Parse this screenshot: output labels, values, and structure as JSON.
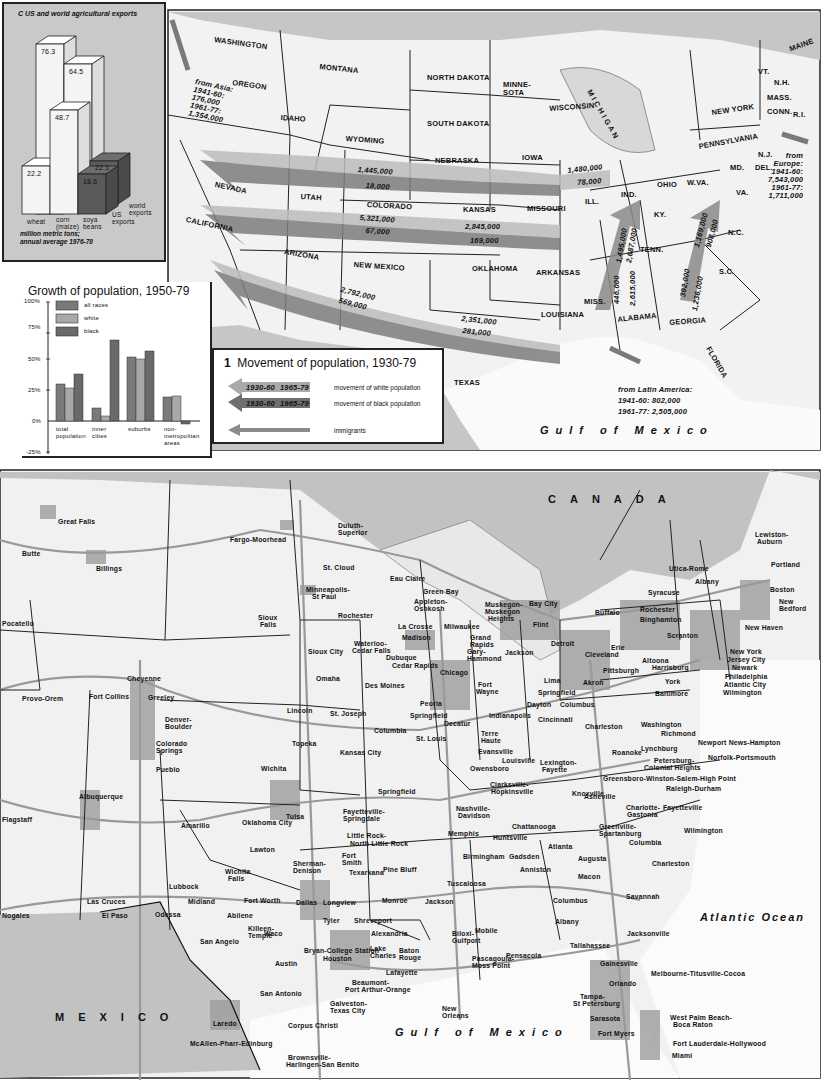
{
  "chart_data": [
    {
      "type": "bar",
      "title": "C  US and world agricultural exports",
      "categories": [
        "wheat",
        "corn (maize)",
        "soya beans"
      ],
      "series": [
        {
          "name": "US exports",
          "values": [
            22.2,
            48.7,
            18.6
          ]
        },
        {
          "name": "world exports",
          "values": [
            76.3,
            64.5,
            22.1
          ]
        }
      ],
      "ylabel": "million metric tons; annual average 1976-78",
      "legend": [
        "world exports",
        "US exports"
      ]
    },
    {
      "type": "bar",
      "title": "Growth of population, 1950-79",
      "categories": [
        "total population",
        "inner cities",
        "suburbs",
        "non-metropolitan areas"
      ],
      "series": [
        {
          "name": "all races",
          "values": [
            30,
            11,
            52,
            20
          ]
        },
        {
          "name": "white",
          "values": [
            27,
            4,
            51,
            20
          ]
        },
        {
          "name": "black",
          "values": [
            38,
            65,
            56,
            -2
          ]
        }
      ],
      "yticks": [
        "100%",
        "75%",
        "50%",
        "25%",
        "0%",
        "-25%"
      ],
      "ylim": [
        -25,
        100
      ],
      "grid": false,
      "legend_position": "top-left"
    }
  ],
  "chartC": {
    "title": "C  US and world agricultural exports",
    "values": {
      "wheat_world": "76.3",
      "corn_world": "64.5",
      "corn_us": "48.7",
      "wheat_us": "22.2",
      "soya_world": "22.1",
      "soya_us": "18.6"
    },
    "categories": [
      "wheat",
      "corn",
      "(maize)",
      "soya",
      "beans"
    ],
    "legend_world": [
      "world",
      "exports"
    ],
    "legend_us": [
      "US",
      "exports"
    ],
    "footnote": [
      "million metric tons;",
      "annual average 1976-78"
    ]
  },
  "chartG": {
    "title": "Growth of population, 1950-79",
    "yticks": [
      "100%",
      "75%",
      "50%",
      "25%",
      "0%",
      "-25%"
    ],
    "legend": [
      "all races",
      "white",
      "black"
    ],
    "colors": {
      "all_races": "#7a7a7a",
      "white": "#a8a8a8",
      "black": "#6a6a6a"
    },
    "categories": [
      [
        "total",
        "population"
      ],
      [
        "inner",
        "cities"
      ],
      [
        "suburbs"
      ],
      [
        "non-",
        "metropolitan",
        "areas"
      ]
    ]
  },
  "legend": {
    "number": "1",
    "title": "Movement of population, 1930-79",
    "arrow_labels": [
      "1930-60",
      "1965-79"
    ],
    "rows": [
      "movement of white population",
      "movement of black population",
      "immigrants"
    ]
  },
  "top_map": {
    "states": [
      "WASHINGTON",
      "MONTANA",
      "NORTH DAKOTA",
      "MINNE-",
      "SOTA",
      "OREGON",
      "IDAHO",
      "SOUTH DAKOTA",
      "WISCONSIN",
      "WYOMING",
      "NEBRASKA",
      "IOWA",
      "NEVADA",
      "UTAH",
      "COLORADO",
      "KANSAS",
      "MISSOURI",
      "CALIFORNIA",
      "ARIZONA",
      "NEW MEXICO",
      "OKLAHOMA",
      "ARKANSAS",
      "LOUISIANA",
      "TEXAS",
      "MISS.",
      "ALABAMA",
      "GEORGIA",
      "FLORIDA",
      "TENN.",
      "KY.",
      "ILL.",
      "IND.",
      "OHIO",
      "W.VA.",
      "VA.",
      "N.C.",
      "S.C.",
      "MD.",
      "DEL.",
      "N.J.",
      "PENNSYLVANIA",
      "NEW YORK",
      "VT.",
      "N.H.",
      "MAINE",
      "MASS.",
      "CONN.",
      "R.I.",
      "M I C H I G A N"
    ],
    "flows": [
      "1,445,000",
      "18,000",
      "5,321,000",
      "67,000",
      "2,845,000",
      "169,000",
      "2,792,000",
      "569,000",
      "2,351,000",
      "281,000",
      "1,480,000",
      "78,000",
      "1,495,000",
      "2,687,000",
      "446,000",
      "2,615,000",
      "1,169,000",
      "908,000",
      "392,000",
      "1,236,000"
    ],
    "asia": [
      "from Asia:",
      "1941-60:",
      "176,000",
      "1961-77:",
      "1,354,000"
    ],
    "europe": [
      "from",
      "Europe:",
      "1941-60:",
      "7,543,000",
      "1961-77:",
      "1,711,000"
    ],
    "latin": [
      "from Latin America:",
      "1941-60: 802,000",
      "1961-77: 2,505,000"
    ],
    "sea": "Gulf of Mexico"
  },
  "bottom_map": {
    "canada": "CANADA",
    "mexico": "MEXICO",
    "gulf": "Gulf of Mexico",
    "atlantic": "Atlantic Ocean",
    "cities": [
      [
        "Great Falls",
        58,
        518
      ],
      [
        "Butte",
        22,
        550
      ],
      [
        "Billings",
        96,
        565
      ],
      [
        "Pocatello",
        2,
        620
      ],
      [
        "Fargo-Moorhead",
        230,
        536
      ],
      [
        "Duluth-",
        338,
        522
      ],
      [
        "Superior",
        338,
        529
      ],
      [
        "St. Cloud",
        323,
        564
      ],
      [
        "Minneapolis-",
        306,
        586
      ],
      [
        "St Paul",
        312,
        593
      ],
      [
        "Sioux",
        258,
        614
      ],
      [
        "Falls",
        260,
        621
      ],
      [
        "Rochester",
        338,
        612
      ],
      [
        "Eau Claire",
        390,
        575
      ],
      [
        "Green Bay",
        423,
        588
      ],
      [
        "Appleton-",
        414,
        598
      ],
      [
        "Oshkosh",
        414,
        605
      ],
      [
        "La Crosse",
        398,
        623
      ],
      [
        "Milwaukee",
        444,
        623
      ],
      [
        "Madison",
        402,
        634
      ],
      [
        "Muskegon-",
        485,
        601
      ],
      [
        "Muskegon",
        485,
        608
      ],
      [
        "Heights",
        488,
        615
      ],
      [
        "Bay City",
        529,
        600
      ],
      [
        "Flint",
        533,
        621
      ],
      [
        "Grand",
        470,
        634
      ],
      [
        "Rapids",
        470,
        641
      ],
      [
        "Detroit",
        551,
        640
      ],
      [
        "Gary-",
        467,
        648
      ],
      [
        "Hammond",
        467,
        655
      ],
      [
        "Jackson",
        505,
        649
      ],
      [
        "Sioux City",
        308,
        648
      ],
      [
        "Waterloo-",
        354,
        640
      ],
      [
        "Cedar Falls",
        352,
        647
      ],
      [
        "Dubuque",
        386,
        654
      ],
      [
        "Cedar Rapids",
        392,
        662
      ],
      [
        "Chicago",
        440,
        669
      ],
      [
        "Omaha",
        316,
        675
      ],
      [
        "Des Moines",
        365,
        682
      ],
      [
        "Fort",
        478,
        681
      ],
      [
        "Wayne",
        476,
        688
      ],
      [
        "Lima",
        544,
        677
      ],
      [
        "Springfield",
        538,
        689
      ],
      [
        "Akron",
        583,
        679
      ],
      [
        "Columbus",
        560,
        701
      ],
      [
        "Dayton",
        527,
        701
      ],
      [
        "Cincinnati",
        538,
        716
      ],
      [
        "Peoria",
        420,
        700
      ],
      [
        "Springfield",
        410,
        712
      ],
      [
        "Decatur",
        444,
        720
      ],
      [
        "Indianapolis",
        489,
        712
      ],
      [
        "St. Joseph",
        330,
        710
      ],
      [
        "Lincoln",
        287,
        707
      ],
      [
        "Columbia",
        374,
        727
      ],
      [
        "St. Louis",
        416,
        735
      ],
      [
        "Terre",
        481,
        730
      ],
      [
        "Haute",
        481,
        737
      ],
      [
        "Evansville",
        478,
        748
      ],
      [
        "Topeka",
        292,
        740
      ],
      [
        "Kansas City",
        340,
        749
      ],
      [
        "Owensboro",
        470,
        765
      ],
      [
        "Louisville",
        502,
        757
      ],
      [
        "Lexington-",
        540,
        759
      ],
      [
        "Fayette",
        542,
        766
      ],
      [
        "Clarksville-",
        490,
        781
      ],
      [
        "Hopkinsville",
        491,
        788
      ],
      [
        "Springfield",
        378,
        788
      ],
      [
        "Wichita",
        261,
        765
      ],
      [
        "Knoxville",
        572,
        790
      ],
      [
        "Nashville-",
        456,
        805
      ],
      [
        "Davidson",
        458,
        812
      ],
      [
        "Chattanooga",
        512,
        823
      ],
      [
        "Fayetteville-",
        343,
        808
      ],
      [
        "Springdale",
        343,
        815
      ],
      [
        "Little Rock-",
        347,
        832
      ],
      [
        "North Little Rock",
        350,
        840
      ],
      [
        "Memphis",
        448,
        830
      ],
      [
        "Huntsville",
        493,
        834
      ],
      [
        "Birmingham",
        463,
        853
      ],
      [
        "Gadsden",
        509,
        853
      ],
      [
        "Anniston",
        520,
        866
      ],
      [
        "Atlanta",
        548,
        843
      ],
      [
        "Augusta",
        578,
        855
      ],
      [
        "Fort",
        342,
        852
      ],
      [
        "Smith",
        342,
        859
      ],
      [
        "Texarkana",
        349,
        869
      ],
      [
        "Pine Bluff",
        383,
        866
      ],
      [
        "Tuscaloosa",
        447,
        880
      ],
      [
        "Macon",
        578,
        873
      ],
      [
        "Columbus",
        553,
        897
      ],
      [
        "Albany",
        555,
        918
      ],
      [
        "Savannah",
        626,
        893
      ],
      [
        "Oklahoma City",
        242,
        819
      ],
      [
        "Tulsa",
        286,
        813
      ],
      [
        "Amarillo",
        181,
        822
      ],
      [
        "Lawton",
        250,
        846
      ],
      [
        "Sherman-",
        293,
        860
      ],
      [
        "Denison",
        293,
        867
      ],
      [
        "Wichita",
        225,
        868
      ],
      [
        "Falls",
        228,
        875
      ],
      [
        "Lubbock",
        169,
        883
      ],
      [
        "Fort Worth",
        244,
        897
      ],
      [
        "Dallas",
        296,
        899
      ],
      [
        "Longview",
        323,
        899
      ],
      [
        "Tyler",
        323,
        917
      ],
      [
        "Monroe",
        382,
        897
      ],
      [
        "Jackson",
        425,
        898
      ],
      [
        "Shreveport",
        354,
        917
      ],
      [
        "Alexandria",
        371,
        930
      ],
      [
        "Biloxi-",
        452,
        930
      ],
      [
        "Gulfport",
        452,
        937
      ],
      [
        "Mobile",
        475,
        927
      ],
      [
        "Midland",
        188,
        898
      ],
      [
        "Odessa",
        155,
        911
      ],
      [
        "Abilene",
        227,
        912
      ],
      [
        "San Angelo",
        200,
        938
      ],
      [
        "Killeen-",
        248,
        925
      ],
      [
        "Temple",
        248,
        932
      ],
      [
        "Waco",
        264,
        930
      ],
      [
        "Bryan-College Station",
        304,
        947
      ],
      [
        "Houston",
        323,
        955
      ],
      [
        "Lake",
        370,
        945
      ],
      [
        "Charles",
        370,
        952
      ],
      [
        "Baton",
        399,
        947
      ],
      [
        "Rouge",
        399,
        954
      ],
      [
        "Lafayette",
        386,
        969
      ],
      [
        "Pascagoula-",
        472,
        955
      ],
      [
        "Moss Point",
        472,
        962
      ],
      [
        "Pensacola",
        506,
        952
      ],
      [
        "Tallahassee",
        570,
        942
      ],
      [
        "Jacksonville",
        627,
        930
      ],
      [
        "Gainesville",
        600,
        960
      ],
      [
        "Austin",
        275,
        960
      ],
      [
        "San Antonio",
        260,
        990
      ],
      [
        "Beaumont-",
        352,
        979
      ],
      [
        "Port Arthur-Orange",
        345,
        986
      ],
      [
        "Galveston-",
        330,
        1000
      ],
      [
        "Texas City",
        330,
        1007
      ],
      [
        "New",
        442,
        1005
      ],
      [
        "Orleans",
        442,
        1012
      ],
      [
        "Orlando",
        609,
        980
      ],
      [
        "Melbourne-Titusville-Cocoa",
        651,
        970
      ],
      [
        "Tampa-",
        580,
        993
      ],
      [
        "St Petersburg",
        573,
        1000
      ],
      [
        "Sarasota",
        590,
        1015
      ],
      [
        "Fort Myers",
        598,
        1030
      ],
      [
        "West Palm Beach-",
        670,
        1014
      ],
      [
        "Boca Raton",
        673,
        1021
      ],
      [
        "Fort Lauderdale-Hollywood",
        673,
        1040
      ],
      [
        "Miami",
        672,
        1052
      ],
      [
        "Corpus Christi",
        288,
        1022
      ],
      [
        "Laredo",
        213,
        1020
      ],
      [
        "McAllen-Pharr-Edinburg",
        190,
        1040
      ],
      [
        "Brownsville-",
        288,
        1054
      ],
      [
        "Harlingen-San Benito",
        286,
        1061
      ],
      [
        "Las Cruces",
        87,
        898
      ],
      [
        "El Paso",
        102,
        912
      ],
      [
        "Nogales",
        2,
        912
      ],
      [
        "Provo-Orem",
        22,
        695
      ],
      [
        "Fort Collins",
        89,
        693
      ],
      [
        "Greeley",
        148,
        694
      ],
      [
        "Cheyenne",
        127,
        675
      ],
      [
        "Denver-",
        165,
        716
      ],
      [
        "Boulder",
        165,
        723
      ],
      [
        "Colorado",
        156,
        740
      ],
      [
        "Springs",
        156,
        747
      ],
      [
        "Pueblo",
        156,
        766
      ],
      [
        "Albuquerque",
        79,
        793
      ],
      [
        "Flagstaff",
        2,
        816
      ],
      [
        "Charleston",
        585,
        723
      ],
      [
        "Washington",
        641,
        721
      ],
      [
        "Richmond",
        661,
        730
      ],
      [
        "Newport News-Hampton",
        698,
        739
      ],
      [
        "Norfolk-Portsmouth",
        708,
        754
      ],
      [
        "Roanoke",
        612,
        749
      ],
      [
        "Lynchburg",
        641,
        745
      ],
      [
        "Petersburg-",
        654,
        757
      ],
      [
        "Colonial Heights",
        644,
        764
      ],
      [
        "Greensboro-Winston-Salem-High Point",
        603,
        775
      ],
      [
        "Raleigh-Durham",
        666,
        785
      ],
      [
        "Asheville",
        584,
        793
      ],
      [
        "Charlotte-",
        626,
        804
      ],
      [
        "Gastonia",
        627,
        811
      ],
      [
        "Fayetteville",
        663,
        804
      ],
      [
        "Wilmington",
        684,
        827
      ],
      [
        "Greenville-",
        599,
        823
      ],
      [
        "Spartanburg",
        599,
        830
      ],
      [
        "Columbia",
        629,
        839
      ],
      [
        "Charleston",
        652,
        860
      ],
      [
        "Buffalo",
        595,
        609
      ],
      [
        "Rochester",
        640,
        606
      ],
      [
        "Binghamton",
        640,
        616
      ],
      [
        "Syracuse",
        648,
        589
      ],
      [
        "Utica-Rome",
        669,
        565
      ],
      [
        "Albany",
        695,
        578
      ],
      [
        "Lewiston-",
        755,
        531
      ],
      [
        "Auburn",
        757,
        538
      ],
      [
        "Portland",
        771,
        561
      ],
      [
        "Boston",
        770,
        586
      ],
      [
        "New",
        779,
        598
      ],
      [
        "Bedford",
        779,
        605
      ],
      [
        "New Haven",
        745,
        624
      ],
      [
        "Erie",
        611,
        644
      ],
      [
        "Cleveland",
        585,
        651
      ],
      [
        "Scranton",
        667,
        632
      ],
      [
        "New York",
        730,
        648
      ],
      [
        "Jersey City",
        727,
        656
      ],
      [
        "Newark",
        732,
        664
      ],
      [
        "Philadelphia",
        725,
        673
      ],
      [
        "Atlantic City",
        724,
        681
      ],
      [
        "Wilmington",
        723,
        689
      ],
      [
        "Altoona",
        642,
        657
      ],
      [
        "Harrisburg",
        652,
        664
      ],
      [
        "Pittsburgh",
        603,
        667
      ],
      [
        "York",
        665,
        678
      ],
      [
        "Baltimore",
        655,
        690
      ]
    ]
  }
}
